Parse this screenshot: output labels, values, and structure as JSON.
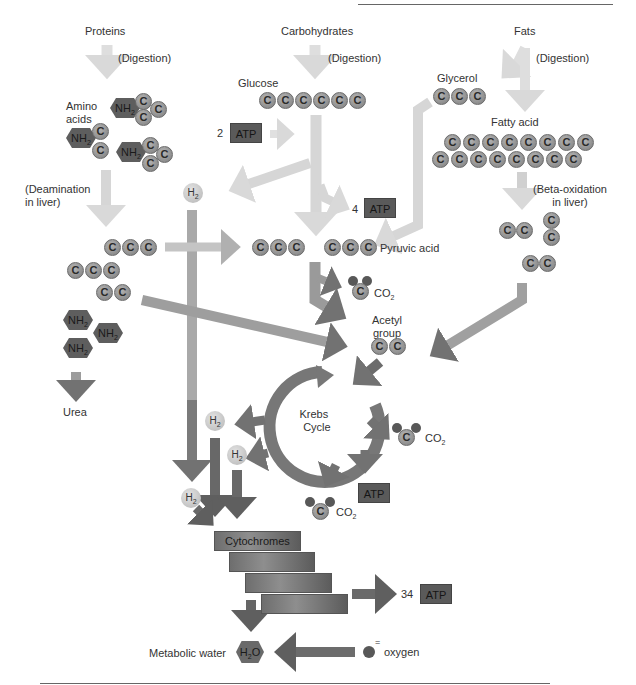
{
  "sources": {
    "proteins": "Proteins",
    "carbohydrates": "Carbohydrates",
    "fats": "Fats"
  },
  "steps": {
    "digestion": "(Digestion)",
    "deamination_line1": "(Deamination",
    "deamination_line2": "in liver)",
    "beta_line1": "(Beta-oxidation",
    "beta_line2": "in liver)"
  },
  "molecules": {
    "amino_line1": "Amino",
    "amino_line2": "acids",
    "glucose": "Glucose",
    "glycerol": "Glycerol",
    "fatty_acid": "Fatty acid",
    "pyruvic_acid": "Pyruvic acid",
    "acetyl_line1": "Acetyl",
    "acetyl_line2": "group",
    "urea": "Urea",
    "carbon": "C",
    "nh2": "NH",
    "h2": "H",
    "subscript_2": "2",
    "co2": "CO",
    "h2o_h": "H",
    "h2o_o": "O",
    "oxygen": "oxygen",
    "oxygen_charge": "="
  },
  "cycle": {
    "line1": "Krebs",
    "line2": "Cycle"
  },
  "atp": {
    "label": "ATP",
    "glycolysis_input": "2",
    "glycolysis_output": "4",
    "electron_transport_output": "34"
  },
  "electron_transport": {
    "cytochromes": "Cytochromes",
    "metabolic_water": "Metabolic water"
  },
  "colors": {
    "light_arrow": "#d9d9d9",
    "mid_arrow": "#a8a8a8",
    "dark_arrow": "#6f6f6f",
    "carbon_fill": "#8f8f8f",
    "hex_fill": "#5e5e5e"
  }
}
